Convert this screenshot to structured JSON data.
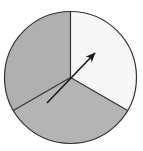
{
  "figure": {
    "name": "spinner-wheel",
    "type": "spinner",
    "title": "",
    "background_color": "#ffffff",
    "width": 143,
    "height": 151
  },
  "circle": {
    "center_x": 70.5,
    "center_y": 77.5,
    "radius": 66,
    "outline_color": "#333333",
    "outline_width": 1.2
  },
  "chart_data": {
    "type": "pie",
    "title": "",
    "xlabel": "",
    "ylabel": "",
    "center": [
      70.5,
      77.5
    ],
    "radius": 66,
    "legend": "none",
    "grid": false,
    "categories": [
      "Right sector",
      "Lower sector",
      "Left sector"
    ],
    "values": [
      120,
      120,
      120
    ],
    "units": "degrees",
    "sectors": [
      {
        "label": "Right sector",
        "start_angle_deg": -30,
        "end_angle_deg": 90,
        "sweep_deg": 120,
        "fraction": 0.3333,
        "fill": "#f7f7f7"
      },
      {
        "label": "Lower sector",
        "start_angle_deg": 210,
        "end_angle_deg": 330,
        "sweep_deg": 120,
        "fraction": 0.3333,
        "fill": "#b4b4b4"
      },
      {
        "label": "Left sector",
        "start_angle_deg": 90,
        "end_angle_deg": 210,
        "sweep_deg": 120,
        "fraction": 0.3333,
        "fill": "#b0b0b0"
      }
    ],
    "dividers": [
      {
        "label": "divider-top",
        "angle_deg": 90
      },
      {
        "label": "divider-lower-left",
        "angle_deg": 210
      },
      {
        "label": "divider-lower-right",
        "angle_deg": 330
      }
    ]
  },
  "pointer": {
    "label": "spinner-arrow",
    "angle_deg": 48,
    "tip_x": 95,
    "tip_y": 53,
    "tail_x": 47,
    "tail_y": 103,
    "color": "#1a1a1a",
    "line_width": 1.6,
    "head_length": 9,
    "head_width": 6,
    "pivot_x": 70.5,
    "pivot_y": 79
  }
}
